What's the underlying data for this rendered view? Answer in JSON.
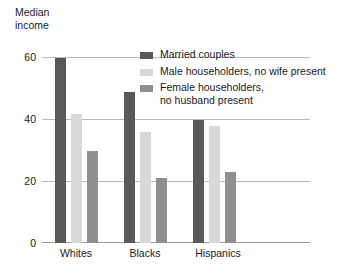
{
  "chart_data": {
    "type": "bar",
    "title": "",
    "ylabel": "Median\nincome",
    "xlabel": "",
    "categories": [
      "Whites",
      "Blacks",
      "Hispanics"
    ],
    "series": [
      {
        "name": "Married couples",
        "color": "#595959",
        "values": [
          60,
          49,
          40
        ]
      },
      {
        "name": "Male householders, no wife present",
        "color": "#d8d8d8",
        "values": [
          42,
          36,
          38
        ]
      },
      {
        "name": "Female householders,\nno husband present",
        "color": "#8f8f8f",
        "values": [
          30,
          21,
          23
        ]
      }
    ],
    "yticks": [
      0,
      20,
      40,
      60
    ],
    "ylim": [
      0,
      60
    ],
    "grid": true,
    "legend_position": "top-right"
  },
  "axis": {
    "y_title": "Median\nincome",
    "tick_0": "0",
    "tick_20": "20",
    "tick_40": "40",
    "tick_60": "60"
  },
  "groups": {
    "g0": "Whites",
    "g1": "Blacks",
    "g2": "Hispanics"
  },
  "legend": {
    "item0": "Married couples",
    "item1": "Male householders, no wife present",
    "item2": "Female householders,\nno husband present"
  }
}
